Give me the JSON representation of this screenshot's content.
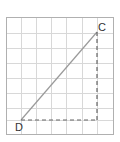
{
  "diagram": {
    "grid": {
      "cols": 7,
      "rows": 8,
      "x0": 6,
      "y0": 18,
      "cell": 15,
      "line_color": "#d8d8d8",
      "border_color": "#aaaaaa"
    },
    "points": [
      {
        "label": "C",
        "x": 97,
        "y": 32
      },
      {
        "label": "D",
        "x": 21,
        "y": 120
      }
    ],
    "segments": [
      {
        "from": "D",
        "to": "C",
        "style": "solid",
        "color": "#999999"
      },
      {
        "from": "D",
        "to": "corner",
        "style": "dashed",
        "color": "#666666"
      },
      {
        "from": "C",
        "to": "corner",
        "style": "dashed",
        "color": "#666666"
      }
    ],
    "corner": {
      "x": 97,
      "y": 120
    }
  },
  "labels": {
    "c": "C",
    "d": "D"
  }
}
